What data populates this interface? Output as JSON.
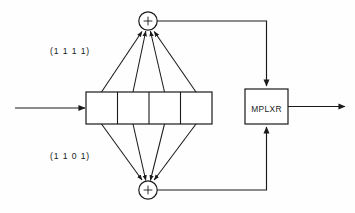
{
  "diagram": {
    "background_color": "#fefefe",
    "line_color": "#1a1a1a",
    "labels": {
      "top_tap_polynomial": "(1 1 1 1)",
      "bottom_tap_polynomial": "(1 1 0 1)",
      "multiplexer": "MPLXR",
      "top_adder": "+",
      "bottom_adder": "+"
    },
    "shift_register": {
      "cell_count": 4,
      "cells": [
        "",
        "",
        "",
        ""
      ]
    },
    "adders": [
      {
        "name": "top-adder",
        "symbol": "+",
        "input_count": 4
      },
      {
        "name": "bottom-adder",
        "symbol": "+",
        "input_count": 4
      }
    ],
    "signals": {
      "input_label": "",
      "output_label": ""
    }
  }
}
